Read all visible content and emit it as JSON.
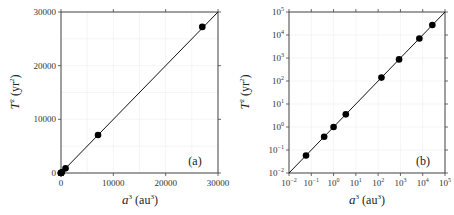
{
  "chart_data": [
    {
      "type": "scatter",
      "panel": "(a)",
      "title": "",
      "xlabel": "a³ (au³)",
      "ylabel": "T² (yr²)",
      "xscale": "linear",
      "yscale": "linear",
      "xlim": [
        0,
        30000
      ],
      "ylim": [
        0,
        30000
      ],
      "xticks": [
        "0",
        "10000",
        "20000",
        "30000"
      ],
      "yticks": [
        "0",
        "10000",
        "20000",
        "30000"
      ],
      "grid": true,
      "series": [
        {
          "name": "planets",
          "x": [
            0.058,
            0.378,
            1.0,
            3.54,
            140.6,
            867.9,
            7079,
            27000
          ],
          "y": [
            0.058,
            0.378,
            1.0,
            3.54,
            140.7,
            868.0,
            7069,
            27225
          ]
        },
        {
          "name": "T² = a³ line",
          "x": [
            0,
            30000
          ],
          "y": [
            0,
            30000
          ]
        }
      ]
    },
    {
      "type": "scatter",
      "panel": "(b)",
      "title": "",
      "xlabel": "a³ (au³)",
      "ylabel": "T² (yr²)",
      "xscale": "log",
      "yscale": "log",
      "xlim": [
        0.01,
        100000
      ],
      "ylim": [
        0.01,
        100000
      ],
      "xticks": [
        "10⁻²",
        "10⁻¹",
        "10⁰",
        "10¹",
        "10²",
        "10³",
        "10⁴",
        "10⁵"
      ],
      "yticks": [
        "10⁻²",
        "10⁻¹",
        "10⁰",
        "10¹",
        "10²",
        "10³",
        "10⁴",
        "10⁵"
      ],
      "grid": true,
      "series": [
        {
          "name": "planets",
          "x": [
            0.058,
            0.378,
            1.0,
            3.54,
            140.6,
            867.9,
            7079,
            27000
          ],
          "y": [
            0.058,
            0.378,
            1.0,
            3.54,
            140.7,
            868.0,
            7069,
            27225
          ]
        },
        {
          "name": "T² = a³ line",
          "x": [
            0.01,
            100000
          ],
          "y": [
            0.01,
            100000
          ]
        }
      ]
    }
  ],
  "panels": {
    "a": {
      "label": "(a)",
      "xlabel_main": "a",
      "xlabel_sup": "3",
      "xlabel_unit": " (au",
      "xlabel_unit_sup": "3",
      "xlabel_close": ")",
      "ylabel_main": "T",
      "ylabel_sup": "2",
      "ylabel_unit": " (yr",
      "ylabel_unit_sup": "2",
      "ylabel_close": ")",
      "xticks": [
        "0",
        "10000",
        "20000",
        "30000"
      ],
      "yticks": [
        "0",
        "10000",
        "20000",
        "30000"
      ]
    },
    "b": {
      "label": "(b)",
      "xlabel_main": "a",
      "xlabel_sup": "3",
      "xlabel_unit": " (au",
      "xlabel_unit_sup": "3",
      "xlabel_close": ")",
      "ylabel_main": "T",
      "ylabel_sup": "2",
      "ylabel_unit": " (yr",
      "ylabel_unit_sup": "2",
      "ylabel_close": ")",
      "tick_base": "10",
      "tick_exps": [
        "−2",
        "−1",
        "0",
        "1",
        "2",
        "3",
        "4",
        "5"
      ]
    }
  }
}
